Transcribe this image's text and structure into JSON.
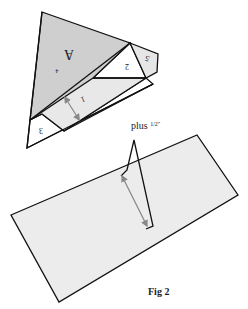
{
  "figure": {
    "caption": "Fig 2",
    "annotation": "plus ",
    "annotation_fraction": "1/2",
    "annotation_unit": "\"",
    "pieces": {
      "big_triangle_label": "A",
      "big_triangle_number": "4",
      "strip_1": "1",
      "triangle_2": "2",
      "strip_3": "3",
      "pentagon_5": "5"
    },
    "colors": {
      "gray_dark": "#cfcfcf",
      "gray_light": "#e6e6e6",
      "white": "#ffffff",
      "outline": "#111111",
      "arrow": "#888888"
    }
  }
}
